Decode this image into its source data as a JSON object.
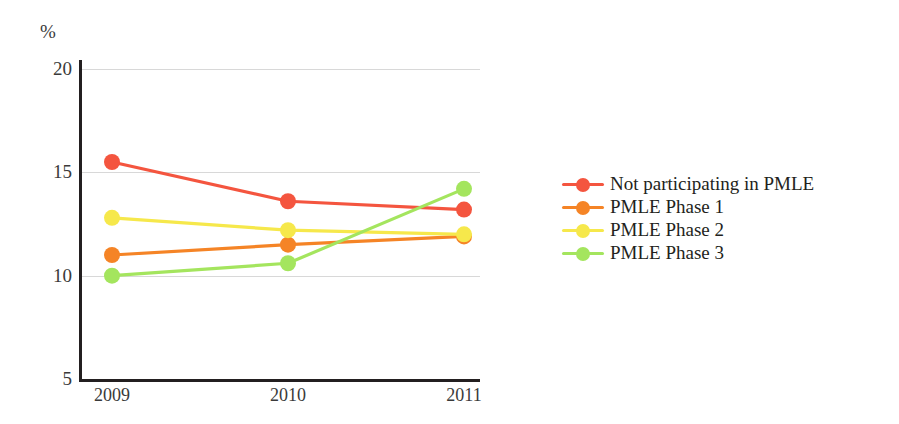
{
  "chart_data": {
    "type": "line",
    "title": "",
    "subtitle": "",
    "xlabel": "",
    "ylabel": "%",
    "categories": [
      "2009",
      "2010",
      "2011"
    ],
    "x": [
      2009,
      2010,
      2011
    ],
    "ylim": [
      5,
      20
    ],
    "y_ticks": [
      5,
      10,
      15,
      20
    ],
    "y_tick_labels": [
      "5",
      "10",
      "15",
      "20"
    ],
    "grid": "horizontal",
    "legend_position": "right",
    "series": [
      {
        "name": "Not participating in PMLE",
        "color": "#F4553F",
        "values": [
          15.5,
          13.6,
          13.2
        ]
      },
      {
        "name": "PMLE Phase 1",
        "color": "#F58426",
        "values": [
          11.0,
          11.5,
          11.9
        ]
      },
      {
        "name": "PMLE Phase 2",
        "color": "#F6E84B",
        "values": [
          12.8,
          12.2,
          12.0
        ]
      },
      {
        "name": "PMLE Phase 3",
        "color": "#A4E55E",
        "values": [
          10.0,
          10.6,
          14.2
        ]
      }
    ]
  },
  "axes": {
    "y_unit": "%",
    "y_ticks": [
      {
        "label": "20",
        "value": 20
      },
      {
        "label": "15",
        "value": 15
      },
      {
        "label": "10",
        "value": 10
      },
      {
        "label": "5",
        "value": 5
      }
    ],
    "x_ticks": [
      {
        "label": "2009"
      },
      {
        "label": "2010"
      },
      {
        "label": "2011"
      }
    ]
  },
  "legend": {
    "items": [
      {
        "label": "Not participating in PMLE",
        "color": "#F4553F"
      },
      {
        "label": "PMLE Phase 1",
        "color": "#F58426"
      },
      {
        "label": "PMLE Phase 2",
        "color": "#F6E84B"
      },
      {
        "label": "PMLE Phase 3",
        "color": "#A4E55E"
      }
    ]
  },
  "colors": {
    "axis": "#231f20",
    "grid": "#d8d8d8",
    "text": "#3a3a3a",
    "background": "#ffffff"
  }
}
